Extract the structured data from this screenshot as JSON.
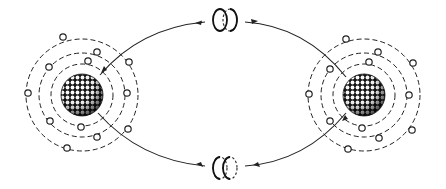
{
  "diagram": {
    "colors": {
      "ink": "#222222",
      "background": "#ffffff"
    },
    "atoms": [
      {
        "name": "left-atom",
        "center": [
          82,
          95
        ],
        "nucleus_radius": 21,
        "orbits": [
          [
            31,
            31
          ],
          [
            43,
            42
          ],
          [
            56,
            56
          ]
        ],
        "electrons": [
          [
            63,
            37
          ],
          [
            97,
            52
          ],
          [
            129,
            62
          ],
          [
            49,
            67
          ],
          [
            88,
            61
          ],
          [
            28,
            93
          ],
          [
            127,
            93
          ],
          [
            50,
            121
          ],
          [
            81,
            127
          ],
          [
            97,
            137
          ],
          [
            128,
            129
          ],
          [
            67,
            148
          ]
        ]
      },
      {
        "name": "right-atom",
        "center": [
          364,
          95
        ],
        "nucleus_radius": 21,
        "orbits": [
          [
            31,
            31
          ],
          [
            43,
            42
          ],
          [
            56,
            56
          ]
        ],
        "electrons": [
          [
            346,
            39
          ],
          [
            378,
            52
          ],
          [
            413,
            63
          ],
          [
            330,
            69
          ],
          [
            369,
            62
          ],
          [
            309,
            94
          ],
          [
            409,
            95
          ],
          [
            330,
            121
          ],
          [
            362,
            128
          ],
          [
            379,
            138
          ],
          [
            412,
            130
          ],
          [
            348,
            149
          ]
        ]
      }
    ],
    "exchange_particles": [
      {
        "name": "top-boson",
        "position": [
          225,
          20
        ]
      },
      {
        "name": "bottom-boson",
        "position": [
          225,
          168
        ]
      }
    ],
    "labels": []
  }
}
